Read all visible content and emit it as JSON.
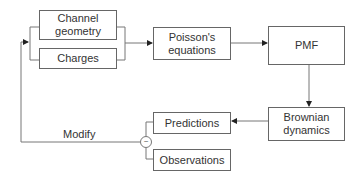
{
  "diagram": {
    "nodes": {
      "channel_geometry": "Channel geometry",
      "charges": "Charges",
      "poisson": "Poisson's equations",
      "pmf": "PMF",
      "brownian": "Brownian dynamics",
      "predictions": "Predictions",
      "observations": "Observations"
    },
    "comparator_symbol": "~",
    "feedback_label": "Modify",
    "edges": [
      {
        "from": "channel_geometry+charges",
        "to": "poisson"
      },
      {
        "from": "poisson",
        "to": "pmf"
      },
      {
        "from": "pmf",
        "to": "brownian"
      },
      {
        "from": "brownian",
        "to": "predictions"
      },
      {
        "from": "predictions~observations",
        "to": "channel_geometry+charges",
        "label": "Modify"
      }
    ],
    "colors": {
      "stroke": "#666666",
      "text": "#333333",
      "background": "#ffffff"
    }
  }
}
